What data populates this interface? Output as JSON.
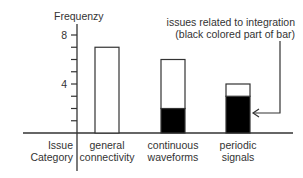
{
  "chart_data": {
    "type": "bar",
    "stacked": true,
    "title": "",
    "ylabel": "Frequenzy",
    "xlabel": "Issue Category",
    "xlabel_lines": [
      "Issue",
      "Category"
    ],
    "ylim": [
      0,
      8
    ],
    "yticks": [
      1,
      2,
      3,
      4,
      5,
      6,
      7,
      8
    ],
    "ytick_labels": {
      "4": "4",
      "8": "8"
    },
    "grid": false,
    "categories": [
      "general connectivity",
      "continuous waveforms",
      "periodic signals"
    ],
    "category_lines": [
      [
        "general",
        "connectivity"
      ],
      [
        "continuous",
        "waveforms"
      ],
      [
        "periodic",
        "signals"
      ]
    ],
    "series": [
      {
        "name": "issues related to integration",
        "color": "#000000",
        "values": [
          0,
          2,
          3
        ]
      },
      {
        "name": "other issues",
        "color": "#ffffff",
        "values": [
          7,
          4,
          1
        ]
      }
    ],
    "totals": [
      7,
      6,
      4
    ],
    "annotation": {
      "lines": [
        "issues related to integration",
        "(black colored part of bar)"
      ],
      "points_to": "periodic signals"
    }
  }
}
